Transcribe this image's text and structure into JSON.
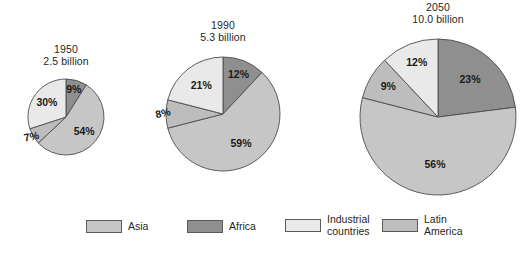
{
  "chart_data": {
    "type": "pie",
    "title": "",
    "subtitle": "",
    "xlabel": "",
    "ylabel": "",
    "grid": false,
    "legend_position": "bottom",
    "units": "percent of world population",
    "categories": [
      "Africa",
      "Asia",
      "Latin America",
      "Industrial countries"
    ],
    "charts": [
      {
        "year": "1950",
        "population": "2.5 billion",
        "slices": [
          {
            "name": "Africa",
            "value": 9,
            "label": "9%"
          },
          {
            "name": "Asia",
            "value": 54,
            "label": "54%"
          },
          {
            "name": "Latin America",
            "value": 7,
            "label": "7%"
          },
          {
            "name": "Industrial countries",
            "value": 30,
            "label": "30%"
          }
        ]
      },
      {
        "year": "1990",
        "population": "5.3 billion",
        "slices": [
          {
            "name": "Africa",
            "value": 12,
            "label": "12%"
          },
          {
            "name": "Asia",
            "value": 59,
            "label": "59%"
          },
          {
            "name": "Latin America",
            "value": 8,
            "label": "8%"
          },
          {
            "name": "Industrial countries",
            "value": 21,
            "label": "21%"
          }
        ]
      },
      {
        "year": "2050",
        "population": "10.0 billion",
        "slices": [
          {
            "name": "Africa",
            "value": 23,
            "label": "23%"
          },
          {
            "name": "Asia",
            "value": 56,
            "label": "56%"
          },
          {
            "name": "Latin America",
            "value": 9,
            "label": "9%"
          },
          {
            "name": "Industrial countries",
            "value": 12,
            "label": "12%"
          }
        ]
      }
    ]
  },
  "colors": {
    "Africa": "#8f8f8f",
    "Asia": "#c6c6c6",
    "Latin America": "#bdbdbd",
    "Industrial countries": "#e9e9e9",
    "outline": "#4d4d4d",
    "text": "#1a1a1a",
    "background": "#ffffff"
  },
  "titles": {
    "chart1": {
      "year": "1950",
      "population": "2.5 billion"
    },
    "chart2": {
      "year": "1990",
      "population": "5.3 billion"
    },
    "chart3": {
      "year": "2050",
      "population": "10.0 billion"
    }
  },
  "legend": {
    "items": [
      {
        "key": "Asia",
        "label": "Asia",
        "color": "#c6c6c6"
      },
      {
        "key": "Africa",
        "label": "Africa",
        "color": "#8f8f8f"
      },
      {
        "key": "Industrial countries",
        "label": "Industrial\ncountries",
        "color": "#e9e9e9"
      },
      {
        "key": "Latin America",
        "label": "Latin\nAmerica",
        "color": "#bdbdbd"
      }
    ]
  },
  "layout": {
    "pies": [
      {
        "cx": 66,
        "cy": 117,
        "r": 38,
        "title_x": 66,
        "title_y": 43
      },
      {
        "cx": 223,
        "cy": 114,
        "r": 57,
        "title_x": 223,
        "title_y": 19
      },
      {
        "cx": 438,
        "cy": 117,
        "r": 78,
        "title_x": 438,
        "title_y": 1
      }
    ],
    "legend_positions": [
      {
        "left": 0,
        "top": 8
      },
      {
        "left": 101,
        "top": 8
      },
      {
        "left": 199,
        "top": 2
      },
      {
        "left": 296,
        "top": 2
      }
    ]
  }
}
